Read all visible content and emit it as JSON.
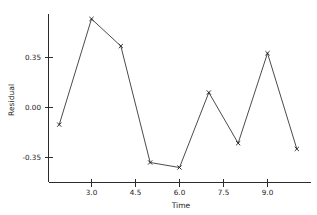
{
  "chart_data": {
    "type": "line",
    "title": "",
    "subtitle": "",
    "xlabel": "Time",
    "ylabel": "Residual",
    "x": [
      1.9,
      3.0,
      4.0,
      5.0,
      6.0,
      7.0,
      8.0,
      9.0,
      10.0
    ],
    "values": [
      -0.12,
      0.62,
      0.43,
      -0.385,
      -0.42,
      0.105,
      -0.25,
      0.38,
      -0.29
    ],
    "series": [
      {
        "name": "Residual",
        "values": [
          -0.12,
          0.62,
          0.43,
          -0.385,
          -0.42,
          0.105,
          -0.25,
          0.38,
          -0.29
        ]
      }
    ],
    "xlim": [
      1.4,
      10.35
    ],
    "ylim": [
      -0.53,
      0.68
    ],
    "xticks": [
      3.0,
      4.5,
      6.0,
      7.5,
      9.0
    ],
    "xtick_labels": [
      "3.0",
      "4.5",
      "6.0",
      "7.5",
      "9.0"
    ],
    "yticks": [
      -0.35,
      0.0,
      0.35
    ],
    "ytick_labels": [
      "-0.35",
      "0.00",
      "0.35"
    ],
    "grid": false,
    "legend": false,
    "legend_position": "none",
    "marker": "x",
    "line_color": "#2b2b2b",
    "axis_color": "#2b2b2b",
    "background_color": "#ffffff",
    "annotations": []
  },
  "axes": {
    "y_tick_0": "-0.35",
    "y_tick_1": "0.00",
    "y_tick_2": "0.35",
    "x_tick_0": "3.0",
    "x_tick_1": "4.5",
    "x_tick_2": "6.0",
    "x_tick_3": "7.5",
    "x_tick_4": "9.0",
    "x_title": "Time",
    "y_title": "Residual"
  }
}
